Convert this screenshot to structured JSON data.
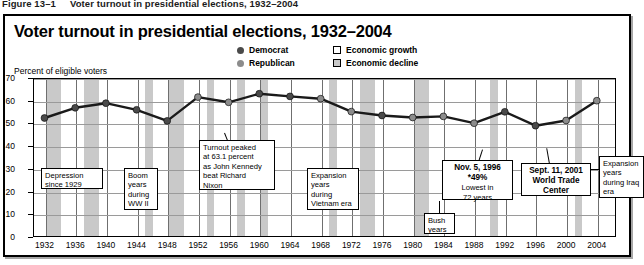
{
  "figure": {
    "number": "Figure 13–1",
    "caption": "Voter turnout in presidential elections, 1932–2004"
  },
  "chart_title": "Voter turnout in presidential elections, 1932–2004",
  "axis_note": "Percent of eligible voters",
  "legend": {
    "democrat": "Democrat",
    "republican": "Republican",
    "economic_growth": "Economic growth",
    "economic_decline": "Economic decline"
  },
  "colors": {
    "democrat_marker": "#4a4a4a",
    "republican_marker": "#8c8c8c",
    "economic_growth_band": "#ffffff",
    "economic_decline_band": "#c9c9c9",
    "line": "#1a1a1a",
    "panel_border": "#000000"
  },
  "annotations": [
    {
      "id": "depression",
      "lines": [
        "Depression",
        "since 1929"
      ]
    },
    {
      "id": "boom-ww2",
      "lines": [
        "Boom",
        "years",
        "during",
        "WW II"
      ]
    },
    {
      "id": "peak-1960",
      "lines": [
        "Turnout peaked",
        "at 63.1 percent",
        "as John Kennedy",
        "beat Richard",
        "Nixon"
      ]
    },
    {
      "id": "vietnam",
      "lines": [
        "Expansion",
        "years",
        "during",
        "Vietnam era"
      ]
    },
    {
      "id": "bush-years",
      "lines": [
        "Bush",
        "years"
      ]
    },
    {
      "id": "nov-1996",
      "lines": [
        "Nov. 5, 1996",
        "*49%",
        "Lowest in",
        "72 years"
      ]
    },
    {
      "id": "sept-11-2001",
      "lines": [
        "Sept. 11, 2001",
        "World Trade",
        "Center"
      ]
    },
    {
      "id": "iraq",
      "lines": [
        "Expansion",
        "years",
        "during Iraq",
        "era"
      ]
    }
  ],
  "chart_data": {
    "type": "line",
    "title": "Voter turnout in presidential elections, 1932–2004",
    "xlabel": "",
    "ylabel": "Percent of eligible voters",
    "ylim": [
      0,
      70
    ],
    "yticks": [
      0,
      10,
      20,
      30,
      40,
      50,
      60,
      70
    ],
    "grid": true,
    "legend_position": "top-right",
    "categories": [
      1932,
      1936,
      1940,
      1944,
      1948,
      1952,
      1956,
      1960,
      1964,
      1968,
      1972,
      1976,
      1980,
      1984,
      1988,
      1992,
      1996,
      2000,
      2004
    ],
    "values": [
      52.4,
      56.9,
      58.9,
      56.0,
      51.1,
      61.6,
      59.3,
      63.1,
      61.9,
      60.9,
      55.2,
      53.5,
      52.6,
      53.1,
      50.1,
      55.1,
      49.0,
      51.3,
      60.0
    ],
    "winner_party": [
      "Democrat",
      "Democrat",
      "Democrat",
      "Democrat",
      "Democrat",
      "Republican",
      "Republican",
      "Democrat",
      "Democrat",
      "Republican",
      "Republican",
      "Democrat",
      "Republican",
      "Republican",
      "Republican",
      "Democrat",
      "Democrat",
      "Republican",
      "Republican"
    ],
    "economy_shading": [
      {
        "label": "Economic decline",
        "start": 1932,
        "end": 1934
      },
      {
        "label": "Economic decline",
        "start": 1937,
        "end": 1939
      },
      {
        "label": "Economic decline",
        "start": 1945,
        "end": 1946
      },
      {
        "label": "Economic decline",
        "start": 1948,
        "end": 1950
      },
      {
        "label": "Economic decline",
        "start": 1953,
        "end": 1954
      },
      {
        "label": "Economic decline",
        "start": 1957,
        "end": 1958
      },
      {
        "label": "Economic decline",
        "start": 1960,
        "end": 1961
      },
      {
        "label": "Economic decline",
        "start": 1969,
        "end": 1970
      },
      {
        "label": "Economic decline",
        "start": 1973,
        "end": 1975
      },
      {
        "label": "Economic decline",
        "start": 1980,
        "end": 1982
      },
      {
        "label": "Economic decline",
        "start": 1990,
        "end": 1991
      },
      {
        "label": "Economic decline",
        "start": 2001,
        "end": 2002
      }
    ]
  }
}
